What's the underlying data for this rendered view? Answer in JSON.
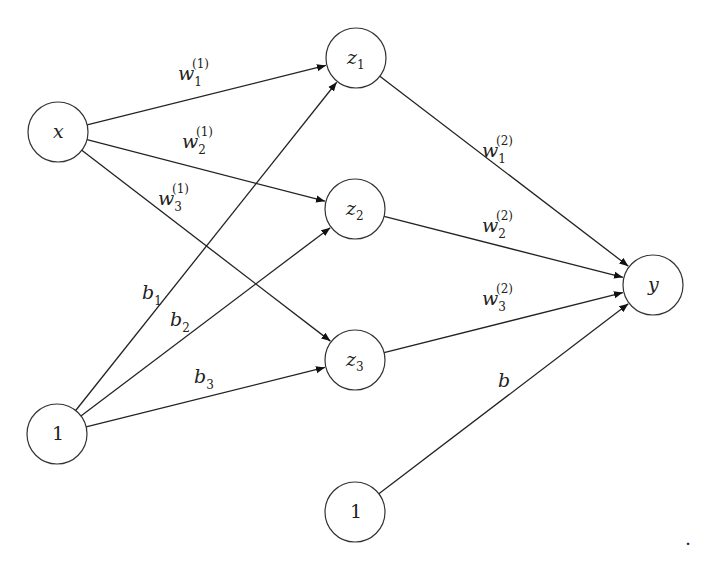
{
  "diagram": {
    "type": "neural-network",
    "nodes": [
      {
        "id": "x",
        "label": "x",
        "sub": "",
        "italic": true,
        "cx": 58,
        "cy": 132,
        "r": 30
      },
      {
        "id": "one_in",
        "label": "1",
        "sub": "",
        "italic": false,
        "cx": 57,
        "cy": 434,
        "r": 30
      },
      {
        "id": "z1",
        "label": "z",
        "sub": "1",
        "italic": true,
        "cx": 356,
        "cy": 58,
        "r": 30
      },
      {
        "id": "z2",
        "label": "z",
        "sub": "2",
        "italic": true,
        "cx": 355,
        "cy": 209,
        "r": 30
      },
      {
        "id": "z3",
        "label": "z",
        "sub": "3",
        "italic": true,
        "cx": 355,
        "cy": 360,
        "r": 30
      },
      {
        "id": "one_hidden",
        "label": "1",
        "sub": "",
        "italic": false,
        "cx": 355,
        "cy": 512,
        "r": 30
      },
      {
        "id": "y",
        "label": "y",
        "sub": "",
        "italic": true,
        "cx": 653,
        "cy": 285,
        "r": 30
      }
    ],
    "edges": [
      {
        "from": "x",
        "to": "z1",
        "label": "w",
        "sub": "1",
        "sup": "(1)",
        "lx": 178,
        "ly": 80
      },
      {
        "from": "x",
        "to": "z2",
        "label": "w",
        "sub": "2",
        "sup": "(1)",
        "lx": 182,
        "ly": 148
      },
      {
        "from": "x",
        "to": "z3",
        "label": "w",
        "sub": "3",
        "sup": "(1)",
        "lx": 158,
        "ly": 205
      },
      {
        "from": "one_in",
        "to": "z1",
        "label": "b",
        "sub": "1",
        "sup": "",
        "lx": 142,
        "ly": 299
      },
      {
        "from": "one_in",
        "to": "z2",
        "label": "b",
        "sub": "2",
        "sup": "",
        "lx": 170,
        "ly": 326
      },
      {
        "from": "one_in",
        "to": "z3",
        "label": "b",
        "sub": "3",
        "sup": "",
        "lx": 194,
        "ly": 383
      },
      {
        "from": "z1",
        "to": "y",
        "label": "w",
        "sub": "1",
        "sup": "(2)",
        "lx": 482,
        "ly": 157
      },
      {
        "from": "z2",
        "to": "y",
        "label": "w",
        "sub": "2",
        "sup": "(2)",
        "lx": 482,
        "ly": 232
      },
      {
        "from": "z3",
        "to": "y",
        "label": "w",
        "sub": "3",
        "sup": "(2)",
        "lx": 482,
        "ly": 305
      },
      {
        "from": "one_hidden",
        "to": "y",
        "label": "b",
        "sub": "",
        "sup": "",
        "lx": 498,
        "ly": 387
      }
    ],
    "trailing_mark": {
      "text": ".",
      "x": 685,
      "y": 545
    }
  }
}
